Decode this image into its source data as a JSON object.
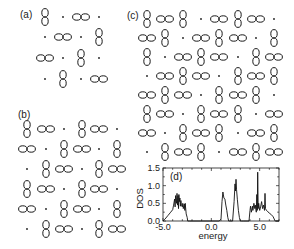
{
  "figure": {
    "panels": [
      {
        "id": "a",
        "label": "(a)",
        "label_pos": [
          20,
          18
        ],
        "col_x": [
          45,
          63,
          81,
          99
        ],
        "row_y": [
          17,
          37,
          58,
          79
        ],
        "grid": [
          "V.H.",
          ".H.V",
          "H.V.",
          ".V.H"
        ]
      },
      {
        "id": "b",
        "label": "(b)",
        "label_pos": [
          18,
          118
        ],
        "col_x": [
          27,
          46,
          64,
          82,
          99,
          117
        ],
        "row_y": [
          129,
          149,
          169,
          189,
          209,
          229
        ],
        "grid": [
          "VH.VH.",
          "H.VH.V",
          ".VH.VH",
          "VH.VH.",
          "H.VH.V",
          ".VH.VH"
        ]
      },
      {
        "id": "c",
        "label": "(c)",
        "label_pos": [
          127,
          19
        ],
        "col_x": [
          147,
          165,
          183,
          201,
          219,
          238,
          256,
          274
        ],
        "row_y": [
          19,
          38,
          57,
          76,
          95,
          114,
          133,
          152
        ],
        "grid": [
          "VHV.HVH.",
          "HV.HVH.V",
          "V.HVH.VH",
          ".HVH.VHV",
          "HVH.VHV.",
          "VH.VHV.H",
          "H.VHV.HV",
          ".VHV.HVH"
        ]
      }
    ],
    "legend": {
      "V": "vertical-orbital",
      "H": "horizontal-orbital",
      ".": "empty-site-dot"
    }
  },
  "chart_data": {
    "type": "line",
    "panel_label": "(d)",
    "title": "",
    "xlabel": "energy",
    "ylabel": "DOS",
    "xlim": [
      -5.0,
      7.0
    ],
    "ylim": [
      0.0,
      1.5
    ],
    "xticks": [
      -5.0,
      0.0,
      5.0
    ],
    "xtick_labels": [
      "-5.0",
      "0.0",
      "5.0"
    ],
    "yticks": [
      0.0,
      0.5,
      1.0,
      1.5
    ],
    "ytick_labels": [
      "0.0",
      "0.5",
      "1.0",
      "1.5"
    ],
    "grid": false,
    "legend": null,
    "series": [
      {
        "name": "DOS",
        "x": [
          -5.0,
          -4.8,
          -4.5,
          -4.2,
          -4.0,
          -3.9,
          -3.8,
          -3.75,
          -3.7,
          -3.6,
          -3.55,
          -3.5,
          -3.45,
          -3.4,
          -3.35,
          -3.3,
          -3.25,
          -3.2,
          -3.15,
          -3.1,
          -3.0,
          -2.95,
          -2.9,
          -2.8,
          -2.75,
          -2.7,
          -2.6,
          -2.5,
          -2.45,
          -2.3,
          -2.0,
          0.8,
          1.0,
          1.1,
          1.2,
          1.3,
          1.4,
          1.5,
          1.6,
          1.7,
          1.8,
          1.9,
          2.0,
          2.2,
          2.35,
          2.45,
          2.5,
          2.55,
          2.6,
          2.7,
          2.8,
          2.9,
          3.0,
          3.1,
          3.3,
          3.9,
          4.0,
          4.05,
          4.15,
          4.25,
          4.3,
          4.4,
          4.5,
          4.55,
          4.65,
          4.7,
          4.75,
          4.8,
          4.85,
          4.9,
          5.0,
          5.1,
          5.2,
          5.3,
          5.4,
          5.5,
          5.55,
          5.6,
          5.7,
          5.8,
          6.0,
          6.2,
          6.4,
          6.6,
          7.0
        ],
        "y": [
          0.0,
          0.05,
          0.15,
          0.25,
          0.32,
          0.45,
          0.62,
          0.4,
          0.72,
          0.5,
          0.78,
          0.45,
          0.72,
          0.35,
          0.75,
          0.55,
          0.65,
          0.42,
          0.58,
          0.45,
          0.4,
          0.5,
          0.35,
          0.48,
          0.3,
          0.5,
          0.2,
          0.1,
          0.0,
          0.0,
          0.0,
          0.0,
          0.05,
          0.55,
          0.82,
          0.65,
          0.62,
          0.45,
          0.3,
          0.1,
          0.0,
          0.0,
          0.0,
          0.0,
          0.55,
          1.05,
          0.85,
          1.18,
          0.9,
          0.6,
          0.3,
          0.1,
          0.0,
          0.0,
          0.0,
          0.0,
          0.3,
          0.42,
          0.25,
          0.42,
          0.3,
          0.5,
          0.35,
          0.45,
          0.25,
          0.75,
          0.3,
          1.38,
          0.35,
          0.5,
          0.3,
          0.4,
          0.55,
          0.35,
          0.45,
          0.3,
          0.78,
          0.35,
          0.3,
          0.28,
          0.22,
          0.18,
          0.12,
          0.0,
          0.0
        ]
      }
    ],
    "frame_px": {
      "left": 163,
      "right": 279,
      "top": 168,
      "bottom": 221
    }
  }
}
